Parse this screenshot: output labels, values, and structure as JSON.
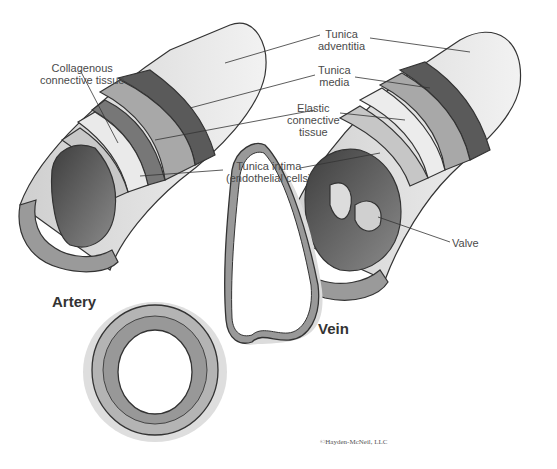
{
  "figure": {
    "title_artery": "Artery",
    "title_vein": "Vein",
    "copyright": "©Hayden-McNeil, LLC"
  },
  "labels": {
    "collagenous": [
      "Collagenous",
      "connective tissue"
    ],
    "adventitia": [
      "Tunica",
      "adventitia"
    ],
    "media": [
      "Tunica",
      "media"
    ],
    "elastic": [
      "Elastic",
      "connective",
      "tissue"
    ],
    "intima": [
      "Tunica intima",
      "(endothelial cells)"
    ],
    "valve": "Valve"
  },
  "colors": {
    "outline": "#333333",
    "adventitia": "#e6e6e6",
    "media": "#a8a8a8",
    "dark_band": "#5a5a5a",
    "lumen": "#6e6e6e",
    "shadow": "#dcdcdc"
  }
}
